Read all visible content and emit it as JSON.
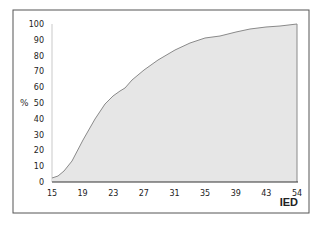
{
  "chart_data": {
    "type": "area",
    "title": "",
    "xlabel": "IED",
    "ylabel": "%",
    "x": [
      15,
      19,
      23,
      27,
      31,
      35,
      39,
      43,
      54
    ],
    "x_tick_labels": [
      "15",
      "19",
      "23",
      "27",
      "31",
      "35",
      "39",
      "43",
      "54"
    ],
    "y_tick_labels": [
      "0",
      "10",
      "20",
      "30",
      "40",
      "50",
      "60",
      "70",
      "80",
      "90",
      "100"
    ],
    "ylim": [
      0,
      100
    ],
    "grid": false,
    "legend": null,
    "series": [
      {
        "name": "cumulative %",
        "values": [
          2.5,
          27,
          54,
          71,
          83,
          91,
          95,
          98,
          100
        ]
      }
    ],
    "curve_points_px": [
      [
        52,
        178
      ],
      [
        58,
        176
      ],
      [
        64,
        171
      ],
      [
        72,
        161
      ],
      [
        83,
        140
      ],
      [
        95,
        119
      ],
      [
        105,
        104
      ],
      [
        113,
        96
      ],
      [
        120,
        91
      ],
      [
        125,
        88
      ],
      [
        132,
        80
      ],
      [
        144,
        70
      ],
      [
        158,
        60
      ],
      [
        175,
        50
      ],
      [
        190,
        43
      ],
      [
        205,
        38
      ],
      [
        220,
        36
      ],
      [
        236,
        32
      ],
      [
        250,
        29
      ],
      [
        266,
        27
      ],
      [
        280,
        26
      ],
      [
        297,
        24
      ]
    ],
    "colors": {
      "fill": "#e6e6e6",
      "line": "#8a8a8a",
      "axis": "#333333",
      "frame": "#555555"
    }
  }
}
